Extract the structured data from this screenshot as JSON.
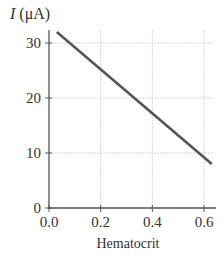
{
  "chart_data": {
    "type": "line",
    "title": "",
    "xlabel": "Hematocrit",
    "ylabel": "I (μA)",
    "ylabel_parts": {
      "var": "I",
      "unit": "(μA)"
    },
    "xlim": [
      0.0,
      0.63
    ],
    "ylim": [
      0,
      33
    ],
    "xticks": [
      0.0,
      0.2,
      0.4,
      0.6
    ],
    "xtick_labels": [
      "0.0",
      "0.2",
      "0.4",
      "0.6"
    ],
    "yticks": [
      0,
      10,
      20,
      30
    ],
    "ytick_labels": [
      "0",
      "10",
      "20",
      "30"
    ],
    "grid": true,
    "legend": null,
    "series": [
      {
        "name": "I",
        "x": [
          0.03,
          0.63
        ],
        "y": [
          32,
          8
        ],
        "color": "#555555"
      }
    ]
  },
  "colors": {
    "line": "#555555",
    "axis": "#555555",
    "grid": "#d6d6d6",
    "text": "#333333"
  }
}
